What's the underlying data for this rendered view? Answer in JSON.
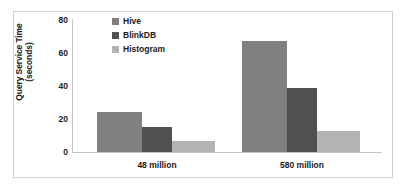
{
  "chart_data": {
    "type": "bar",
    "title": "",
    "xlabel": "",
    "ylabel": "Query Service Time (seconds)",
    "ylabel_line1": "Query Service Time",
    "ylabel_line2": "(seconds)",
    "categories": [
      "48 million",
      "580 million"
    ],
    "series": [
      {
        "name": "Hive",
        "color": "#808080",
        "values": [
          24,
          67
        ]
      },
      {
        "name": "BlinkDB",
        "color": "#505050",
        "values": [
          15,
          38.5
        ]
      },
      {
        "name": "Histogram",
        "color": "#b3b3b3",
        "values": [
          6.7,
          13
        ]
      }
    ],
    "ylim": [
      0,
      80
    ],
    "yticks": [
      0,
      20,
      40,
      60,
      80
    ],
    "ytick_labels": [
      "0",
      "20",
      "40",
      "60",
      "80"
    ],
    "grid": false,
    "legend_position": "top-left-inside",
    "legend_entries": [
      "Hive",
      "BlinkDB",
      "Histogram"
    ],
    "axis_color": "#c6c6c6",
    "frame_color": "#cfcfcf",
    "background": "#ffffff"
  }
}
